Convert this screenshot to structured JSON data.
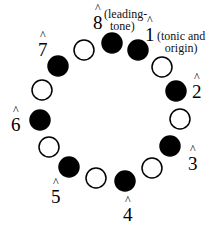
{
  "diagram": {
    "type": "pitch-class-circle",
    "colors": {
      "filled": "#000000",
      "open": "#ffffff",
      "stroke": "#000000"
    },
    "circles": [
      {
        "cx": 112,
        "cy": 43,
        "filled": true
      },
      {
        "cx": 138,
        "cy": 50,
        "filled": true
      },
      {
        "cx": 162,
        "cy": 67,
        "filled": false
      },
      {
        "cx": 176,
        "cy": 91,
        "filled": true
      },
      {
        "cx": 180,
        "cy": 119,
        "filled": false
      },
      {
        "cx": 170,
        "cy": 146,
        "filled": true
      },
      {
        "cx": 152,
        "cy": 168,
        "filled": false
      },
      {
        "cx": 125,
        "cy": 181,
        "filled": true
      },
      {
        "cx": 96,
        "cy": 178,
        "filled": false
      },
      {
        "cx": 69,
        "cy": 167,
        "filled": true
      },
      {
        "cx": 49,
        "cy": 147,
        "filled": false
      },
      {
        "cx": 40,
        "cy": 120,
        "filled": true
      },
      {
        "cx": 42,
        "cy": 90,
        "filled": false
      },
      {
        "cx": 58,
        "cy": 66,
        "filled": true
      },
      {
        "cx": 84,
        "cy": 50,
        "filled": false
      }
    ],
    "degrees": [
      {
        "id": "1",
        "label": "1",
        "hat": "^",
        "note": "(tonic and origin)"
      },
      {
        "id": "2",
        "label": "2",
        "hat": "^"
      },
      {
        "id": "3",
        "label": "3",
        "hat": "^"
      },
      {
        "id": "4",
        "label": "4",
        "hat": "^"
      },
      {
        "id": "5",
        "label": "5",
        "hat": "^"
      },
      {
        "id": "6",
        "label": "6",
        "hat": "^"
      },
      {
        "id": "7",
        "label": "7",
        "hat": "^"
      },
      {
        "id": "8",
        "label": "8",
        "hat": "^",
        "note": "(leading-tone)"
      }
    ],
    "notes": {
      "tonic_line1": "(tonic and",
      "tonic_line2": "origin)",
      "leading_line1": "(leading-",
      "leading_line2": "tone)"
    }
  }
}
